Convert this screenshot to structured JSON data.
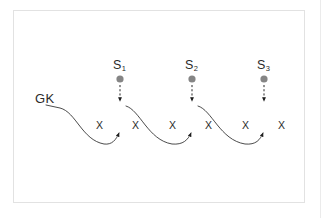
{
  "figure": {
    "type": "state-observation-diagram",
    "background_color": "#ffffff",
    "frame_color": "#e2e2e2",
    "stroke_color": "#2b2b2b",
    "node_color": "#808080",
    "start_label": "GK",
    "states": [
      {
        "name": "S",
        "subscript": "1",
        "cx": 120,
        "cy": 78
      },
      {
        "name": "S",
        "subscript": "2",
        "cx": 192,
        "cy": 78
      },
      {
        "name": "S",
        "subscript": "3",
        "cx": 264,
        "cy": 78
      }
    ],
    "observations": [
      {
        "label": "X",
        "x": 99,
        "y": 125
      },
      {
        "label": "X",
        "x": 135,
        "y": 125
      },
      {
        "label": "X",
        "x": 172,
        "y": 125
      },
      {
        "label": "X",
        "x": 208,
        "y": 125
      },
      {
        "label": "X",
        "x": 245,
        "y": 125
      },
      {
        "label": "X",
        "x": 281,
        "y": 125
      }
    ],
    "emission_arrow_style": "dashed-down",
    "transition_arrow_style": "solid-curve-up"
  }
}
